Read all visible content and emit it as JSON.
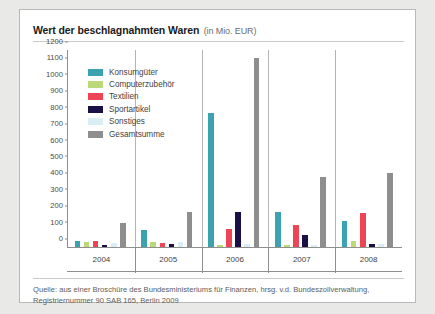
{
  "header": {
    "title": "Wert der beschlagnahmten Waren",
    "subtitle": "(in Mio. EUR)"
  },
  "source": {
    "line1": "Quelle: aus einer Broschüre des Bundesministeriums für Finanzen, hrsg. v.d. Bundeszollverwaltung,",
    "line2": "Registriernummer 90 SAB 165, Berlin 2009"
  },
  "chart_data": {
    "type": "bar",
    "title": "Wert der beschlagnahmten Waren (in Mio. EUR)",
    "xlabel": "",
    "ylabel": "",
    "ylim": [
      0,
      1200
    ],
    "ytick_step": 100,
    "yticks": [
      0,
      100,
      200,
      300,
      400,
      500,
      600,
      700,
      800,
      900,
      1000,
      1100,
      1200
    ],
    "grid": false,
    "legend_position": "inside-top-left",
    "categories": [
      "2004",
      "2005",
      "2006",
      "2007",
      "2008"
    ],
    "series": [
      {
        "name": "Konsumgüter",
        "color": "#3ba3b0",
        "values": [
          35,
          105,
          815,
          215,
          160
        ]
      },
      {
        "name": "Computerzubehör",
        "color": "#bcd97a",
        "values": [
          32,
          28,
          10,
          12,
          38
        ]
      },
      {
        "name": "Textilien",
        "color": "#ef4455",
        "values": [
          35,
          22,
          110,
          135,
          205
        ]
      },
      {
        "name": "Sportartikel",
        "color": "#1b1046",
        "values": [
          14,
          18,
          215,
          75,
          18
        ]
      },
      {
        "name": "Sonstiges",
        "color": "#d8eef4",
        "values": [
          22,
          30,
          18,
          10,
          20
        ]
      },
      {
        "name": "Gesamtsumme",
        "color": "#8e8e8e",
        "values": [
          145,
          215,
          1150,
          425,
          450
        ]
      }
    ]
  }
}
